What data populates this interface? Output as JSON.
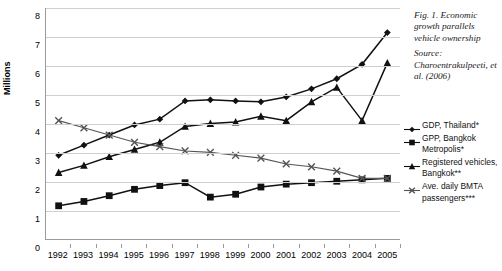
{
  "caption": {
    "title": "Fig. 1. Economic growth parallels vehicle ownership",
    "source": "Source: Charoentrakulpeeti, et al. (2006)"
  },
  "chart_data": {
    "type": "line",
    "title": "",
    "xlabel": "",
    "ylabel": "Millions",
    "ylim": [
      0,
      8
    ],
    "yticks": [
      0,
      1,
      2,
      3,
      4,
      5,
      6,
      7,
      8
    ],
    "grid": true,
    "legend_position": "right",
    "categories": [
      "1992",
      "1993",
      "1994",
      "1995",
      "1996",
      "1997",
      "1998",
      "1999",
      "2000",
      "2001",
      "2002",
      "2003",
      "2004",
      "2005"
    ],
    "series": [
      {
        "name": "GDP, Thailand*",
        "marker": "diamond",
        "color": "#111111",
        "values": [
          2.9,
          3.25,
          3.6,
          3.95,
          4.15,
          4.78,
          4.82,
          4.78,
          4.75,
          4.92,
          5.2,
          5.55,
          6.05,
          7.15
        ]
      },
      {
        "name": "GPP, Bangkok Metropolis*",
        "marker": "square",
        "color": "#111111",
        "values": [
          1.15,
          1.3,
          1.5,
          1.72,
          1.85,
          1.95,
          1.45,
          1.55,
          1.8,
          1.9,
          1.95,
          2.0,
          2.05,
          2.1
        ]
      },
      {
        "name": "Registered vehicles, Bangkok**",
        "marker": "triangle",
        "color": "#111111",
        "values": [
          2.3,
          2.55,
          2.85,
          3.1,
          3.35,
          3.9,
          4.0,
          4.05,
          4.25,
          4.1,
          4.75,
          5.25,
          4.1,
          6.1
        ]
      },
      {
        "name": "Ave. daily BMTA passengers***",
        "marker": "cross",
        "color": "#555555",
        "values": [
          4.1,
          3.85,
          3.6,
          3.35,
          3.2,
          3.05,
          3.0,
          2.9,
          2.8,
          2.6,
          2.5,
          2.35,
          2.1,
          2.1
        ]
      }
    ]
  },
  "legend": {
    "items": [
      {
        "label": "GDP, Thailand*",
        "marker": "diamond"
      },
      {
        "label": "GPP, Bangkok Metropolis*",
        "marker": "square"
      },
      {
        "label": "Registered vehicles, Bangkok**",
        "marker": "triangle"
      },
      {
        "label": "Ave. daily BMTA passengers***",
        "marker": "cross"
      }
    ]
  }
}
